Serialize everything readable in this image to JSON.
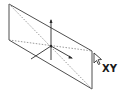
{
  "plane_icon": {
    "label": "XY",
    "description": "plane",
    "colors": {
      "outline": "#3a3a3a",
      "dashed": "#808080",
      "axis": "#2a2a2a",
      "cursor_fill": "#ffffff",
      "cursor_stroke": "#333333",
      "background": "#ffffff"
    }
  }
}
